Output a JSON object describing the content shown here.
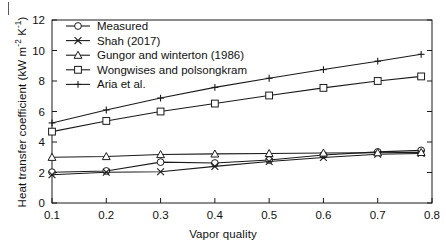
{
  "figure": {
    "panel_marker": "|",
    "background_color": "#ffffff",
    "line_color": "#1a1a1a"
  },
  "chart_data": {
    "type": "line",
    "title": "",
    "xlabel": "Vapor quality",
    "ylabel": "Heat transfer coefficient (kW m-2 K-1)",
    "ylabel_parts": {
      "main": "Heat transfer coefficient (kW m",
      "sup1": "-2",
      "mid": " K",
      "sup2": "-1",
      "tail": ")"
    },
    "xlim": [
      0.1,
      0.8
    ],
    "ylim": [
      0,
      12
    ],
    "xticks": [
      0.1,
      0.2,
      0.3,
      0.4,
      0.5,
      0.6,
      0.7,
      0.8
    ],
    "xtick_labels": [
      "0.1",
      "0.2",
      "0.3",
      "0.4",
      "0.5",
      "0.6",
      "0.7",
      "0.8"
    ],
    "yticks": [
      0,
      2,
      4,
      6,
      8,
      10,
      12
    ],
    "ytick_labels": [
      "0",
      "2",
      "4",
      "6",
      "8",
      "10",
      "12"
    ],
    "grid": false,
    "legend_position": "upper left",
    "x": [
      0.1,
      0.2,
      0.3,
      0.4,
      0.5,
      0.6,
      0.7,
      0.78
    ],
    "series": [
      {
        "name": "Measured",
        "marker": "circle",
        "values": [
          2.02,
          2.1,
          2.68,
          2.62,
          2.82,
          3.15,
          3.35,
          3.45
        ]
      },
      {
        "name": "Shah (2017)",
        "marker": "x-cross",
        "values": [
          1.85,
          2.02,
          2.05,
          2.4,
          2.72,
          2.98,
          3.2,
          3.25
        ]
      },
      {
        "name": "Gungor and winterton (1986)",
        "marker": "triangle",
        "values": [
          3.0,
          3.05,
          3.18,
          3.22,
          3.25,
          3.28,
          3.3,
          3.32
        ]
      },
      {
        "name": "Wongwises and polsongkram",
        "marker": "square",
        "values": [
          4.68,
          5.38,
          6.0,
          6.52,
          7.05,
          7.55,
          8.0,
          8.3
        ]
      },
      {
        "name": "Aria et al.",
        "marker": "plus",
        "values": [
          5.25,
          6.1,
          6.88,
          7.58,
          8.18,
          8.75,
          9.3,
          9.75
        ]
      }
    ]
  },
  "legend": {
    "entries": [
      "Measured",
      "Shah (2017)",
      "Gungor and winterton (1986)",
      "Wongwises and polsongkram",
      "Aria et al."
    ]
  }
}
